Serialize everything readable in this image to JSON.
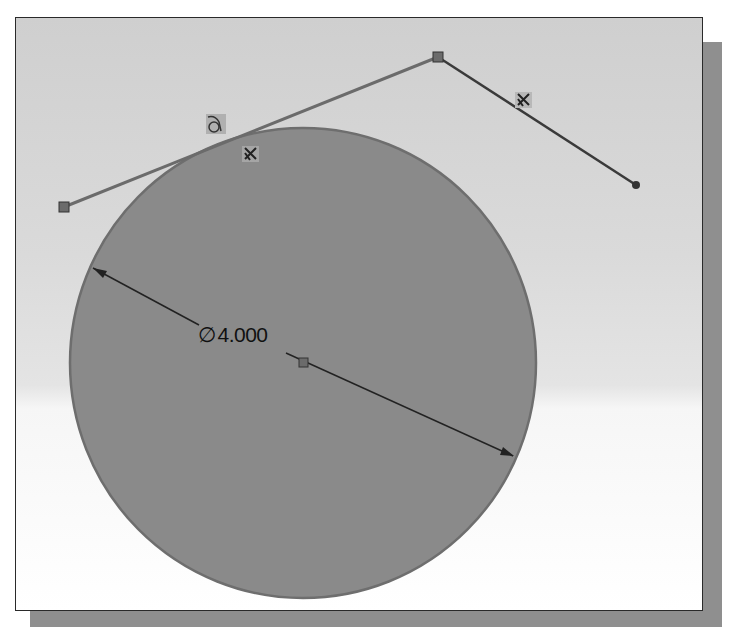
{
  "sketch": {
    "dimension": {
      "symbol": "∅",
      "value": "4.000",
      "type": "diameter"
    },
    "constraints": [
      {
        "name": "tangent",
        "glyph": "∂"
      },
      {
        "name": "fixed",
        "glyph": "⨯"
      },
      {
        "name": "fixed",
        "glyph": "⨯"
      }
    ],
    "colors": {
      "circle_fill": "#8a8a8a",
      "circle_stroke": "#6e6e6e",
      "line_stroke": "#6b6b6b",
      "dimension_stroke": "#222222",
      "frame_border": "#2a2a2a",
      "shadow": "#8f8f8f"
    }
  }
}
